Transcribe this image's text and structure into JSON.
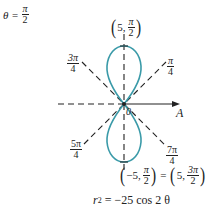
{
  "title": {
    "lhs": "θ =",
    "num": "π",
    "den": "2"
  },
  "angle_labels": {
    "pi_over_4": {
      "num": "π",
      "den": "4"
    },
    "three_pi_over_4": {
      "num": "3π",
      "den": "4"
    },
    "five_pi_over_4": {
      "num": "5π",
      "den": "4"
    },
    "seven_pi_over_4": {
      "num": "7π",
      "den": "4"
    }
  },
  "points": {
    "top": {
      "open": "(",
      "r": "5,",
      "num": "π",
      "den": "2",
      "close": ")"
    },
    "bottom": {
      "left_open": "(",
      "left_r": "−5,",
      "left_num": "π",
      "left_den": "2",
      "left_close": ")",
      "equals": "=",
      "right_open": "(",
      "right_r": "5,",
      "right_num": "3π",
      "right_den": "2",
      "right_close": ")"
    }
  },
  "axis": {
    "polar_axis_label": "A",
    "pole_label": "0"
  },
  "equation": {
    "lhs": "r",
    "exp": "2",
    "rhs": "=  −25 cos 2 θ"
  },
  "colors": {
    "curve": "#3a9aa8",
    "lines": "#222222"
  }
}
